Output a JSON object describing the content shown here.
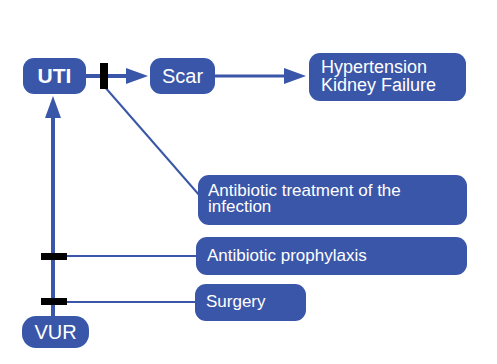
{
  "diagram": {
    "colors": {
      "node_fill": "#3a56a8",
      "edge": "#3a56a8",
      "blocker": "#000000",
      "node_text": "#ffffff"
    },
    "nodes": {
      "uti": {
        "label": "UTI"
      },
      "scar": {
        "label": "Scar"
      },
      "outcome": {
        "line1": "Hypertension",
        "line2": "Kidney Failure"
      },
      "antibiotic_treatment": {
        "line1": "Antibiotic treatment of the",
        "line2": "infection"
      },
      "prophylaxis": {
        "label": "Antibiotic prophylaxis"
      },
      "surgery": {
        "label": "Surgery"
      },
      "vur": {
        "label": "VUR"
      }
    },
    "edges": [
      {
        "from": "VUR",
        "to": "UTI",
        "type": "arrow"
      },
      {
        "from": "UTI",
        "to": "Scar",
        "type": "arrow"
      },
      {
        "from": "Scar",
        "to": "Hypertension / Kidney Failure",
        "type": "arrow"
      },
      {
        "from": "Antibiotic treatment of the infection",
        "to": "UTI→Scar",
        "type": "blocker"
      },
      {
        "from": "Antibiotic prophylaxis",
        "to": "VUR→UTI",
        "type": "blocker"
      },
      {
        "from": "Surgery",
        "to": "VUR→UTI",
        "type": "blocker"
      }
    ]
  }
}
